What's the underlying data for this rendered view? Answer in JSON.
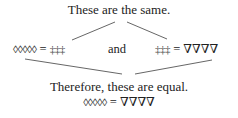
{
  "title": "These are the same.",
  "left_equation": {
    "lhs": "◊◊◊◊◊",
    "op": " = ",
    "rhs": "‡‡‡"
  },
  "connector": "and",
  "right_equation": {
    "lhs": "‡‡‡",
    "op": " = ",
    "rhs": "∇∇∇∇"
  },
  "conclusion": "Therefore, these are equal.",
  "result_equation": {
    "lhs": "◊◊◊◊◊",
    "op": " = ",
    "rhs": "∇∇∇∇"
  },
  "colors": {
    "text": "#222222",
    "lines": "#555555",
    "background": "#ffffff"
  }
}
